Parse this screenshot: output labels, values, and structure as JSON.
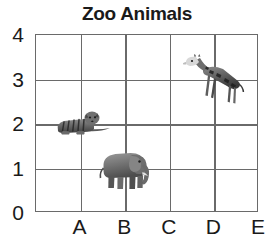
{
  "chart_data": {
    "type": "scatter",
    "title": "Zoo Animals",
    "xlabel": "",
    "ylabel": "",
    "grid": true,
    "legend": "none",
    "x_tick_labels": [
      "A",
      "B",
      "C",
      "D",
      "E"
    ],
    "y_tick_labels": [
      "4",
      "3",
      "2",
      "1",
      "0"
    ],
    "ylim": [
      0,
      4
    ],
    "x_categories": [
      "A",
      "B",
      "C",
      "D",
      "E"
    ],
    "points": [
      {
        "label": "tiger",
        "x": "A",
        "y": 2,
        "icon": "tiger-icon"
      },
      {
        "label": "elephant",
        "x": "B",
        "y": 1,
        "icon": "elephant-icon"
      },
      {
        "label": "giraffe",
        "x": "D",
        "y": 3,
        "icon": "giraffe-icon"
      }
    ]
  },
  "colors": {
    "grid": "#6a6a6a",
    "text": "#1a1a1a",
    "background": "#ffffff",
    "marker": "#4a4a4a"
  }
}
